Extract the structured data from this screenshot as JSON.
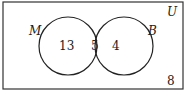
{
  "diagram": {
    "type": "venn",
    "universe_label": "U",
    "sets": [
      {
        "name": "M",
        "only_count": "13"
      },
      {
        "name": "B",
        "only_count": "4"
      }
    ],
    "intersection_count": "5",
    "outside_count": "8"
  }
}
